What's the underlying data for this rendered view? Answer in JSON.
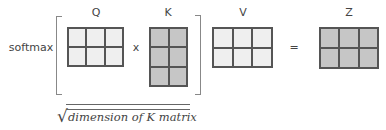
{
  "diagram": {
    "function_label": "softmax",
    "operators": {
      "multiply": "x",
      "equals": "="
    },
    "matrices": [
      {
        "name": "Q",
        "rows": 2,
        "cols": 3,
        "fill": "#efefef"
      },
      {
        "name": "K",
        "rows": 3,
        "cols": 2,
        "fill": "#c6c6c6"
      },
      {
        "name": "V",
        "rows": 2,
        "cols": 3,
        "fill": "#efefef"
      },
      {
        "name": "Z",
        "rows": 2,
        "cols": 3,
        "fill": "#c6c6c6"
      }
    ],
    "denominator": {
      "radical": "√",
      "text": "dimension of K matrix"
    },
    "colors": {
      "border": "#555555",
      "light_fill": "#efefef",
      "dark_fill": "#c6c6c6"
    }
  }
}
